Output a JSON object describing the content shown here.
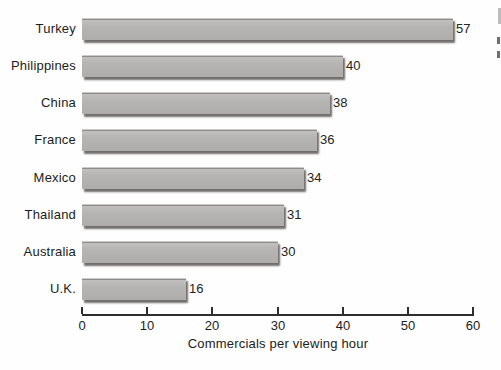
{
  "figure": {
    "background_color": "#fefefe",
    "bar_color": "#b4b3b1",
    "bar_shadow_color": "#484442",
    "axis_color": "#2e2e2e",
    "text_color": "#1c1c1c"
  },
  "chart_data": {
    "type": "bar",
    "orientation": "horizontal",
    "title": "",
    "xlabel": "Commercials per viewing hour",
    "ylabel": "",
    "categories": [
      "Turkey",
      "Philippines",
      "China",
      "France",
      "Mexico",
      "Thailand",
      "Australia",
      "U.K."
    ],
    "values": [
      57,
      40,
      38,
      36,
      34,
      31,
      30,
      16
    ],
    "value_labels": [
      "57",
      "40",
      "38",
      "36",
      "34",
      "31",
      "30",
      "16"
    ],
    "xlim": [
      0,
      60
    ],
    "xticks": [
      0,
      10,
      20,
      30,
      40,
      50,
      60
    ],
    "grid": false,
    "legend": "none"
  },
  "edge_artifacts": {
    "description": "faint cropped print fragments along right page edge"
  }
}
